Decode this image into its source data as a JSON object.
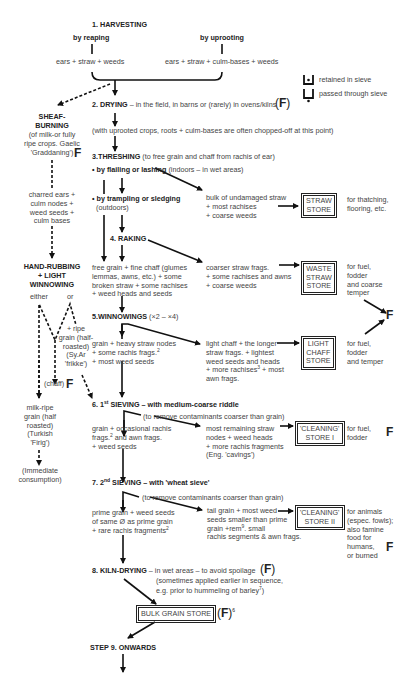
{
  "legend": {
    "retained": "retained in sieve",
    "passed": "passed through sieve"
  },
  "steps": {
    "harvesting": "1. HARVESTING",
    "by_reaping": "by reaping",
    "by_uprooting": "by uprooting",
    "reaping_products": "ears + straw + weeds",
    "uprooting_products": "ears + straw + culm-bases + weeds",
    "drying_title": "2. DRYING",
    "drying_note": " – in the field, in barns or (rarely) in ovens/kilns",
    "uprooted_note": "(with uprooted crops, roots + culm-bases are often chopped-off at this point)",
    "threshing_title": "3.THRESHING",
    "threshing_note": " (to free grain and chaff from rachis of ear)",
    "flailing_title": "• by flailing or lashing",
    "flailing_note": " (indoors – in wet areas)",
    "trampling_title": "• by trampling or sledging",
    "trampling_note": "(outdoors)",
    "raking": "4. RAKING",
    "winnowings_title": "5.WINNOWINGS",
    "winnowings_note": " (×2 – ×4)",
    "sieving1_title": "6. 1",
    "sieving1_sup": "st",
    "sieving1_rest": " SIEVING – with medium-coarse riddle",
    "sieving1_note": "(to remove contaminants coarser than grain)",
    "sieving2_title": "7. 2",
    "sieving2_sup": "nd",
    "sieving2_rest": " SIEVING – with 'wheat sieve'",
    "sieving2_note": "(to remove contaminants coarser than grain)",
    "kiln_title": "8. KILN-DRYING",
    "kiln_note": " – in wet areas – to avoid spoilage",
    "kiln_note2": "(sometimes applied earlier in sequence,",
    "kiln_note3": "e.g. prior to hummeling of barley",
    "kiln_note3_sup": "7",
    "kiln_note3_end": ")",
    "onwards": "STEP 9. ONWARDS"
  },
  "products": {
    "straw_bulk": [
      "bulk of undamaged straw",
      "+ most rachises",
      "+ coarse weeds"
    ],
    "raking_main": [
      "free grain + fine chaff (glumes",
      "lemmas, awns, etc.) + some",
      "broken straw + some rachises",
      "+ weed heads and seeds"
    ],
    "raking_coarse": [
      "coarser straw frags.",
      "+ some rachises and awns",
      "+ coarse weeds"
    ],
    "winnow_main": [
      "grain + heavy straw nodes",
      "+ some rachis frags.",
      "+ most weed seeds"
    ],
    "winnow_main_sup": "2",
    "winnow_light": [
      "light chaff + the longer",
      "straw frags. + lightest",
      "weed seeds and heads",
      "+ more rachises",
      "awn frags."
    ],
    "winnow_light_sup": "3",
    "winnow_light_tail": " + most",
    "sieve1_main": [
      "grain + occasional rachis",
      "frags.",
      " and awn frags.",
      "+ weed seeds"
    ],
    "sieve1_main_sup": "2",
    "sieve1_waste": [
      "most remaining straw",
      "nodes + weed heads",
      "+ more rachis fragments",
      "(Eng. 'cavings')"
    ],
    "sieve2_main": [
      "prime grain + weed seeds",
      "of same Ø as prime grain",
      "+ rare rachis fragments"
    ],
    "sieve2_main_sup": "2",
    "sieve2_tail": [
      "tail grain + most weed",
      "seeds smaller than prime",
      "grain +rem",
      ". small",
      "rachis segments & awn frags."
    ],
    "sieve2_tail_sup": "9"
  },
  "stores": {
    "straw": [
      "STRAW",
      "STORE"
    ],
    "waste_straw": [
      "WASTE",
      "STRAW",
      "STORE"
    ],
    "light_chaff": [
      "LIGHT",
      "CHAFF",
      "STORE"
    ],
    "cleaning1": [
      "'CLEANING'",
      "STORE I"
    ],
    "cleaning2": [
      "'CLEANING'",
      "STORE II"
    ],
    "bulk_grain": "BULK GRAIN STORE",
    "bulk_grain_sup": "6"
  },
  "uses": {
    "straw": [
      "for thatching,",
      "flooring, etc."
    ],
    "waste_straw": [
      "for fuel,",
      "fodder",
      "and coarse",
      "temper"
    ],
    "light_chaff": [
      "for fuel,",
      "fodder",
      "and temper"
    ],
    "cleaning1": [
      "for fuel,",
      "fodder"
    ],
    "cleaning2": [
      "for animals",
      "(espec. fowls);",
      "also famine",
      "food for",
      "humans,",
      "or burned"
    ]
  },
  "side_branch": {
    "sheaf_title": [
      "SHEAF-",
      "BURNING"
    ],
    "sheaf_note": [
      "(of milk-or fully",
      "ripe crops. Gaelic",
      "'Graddaning')"
    ],
    "charred": [
      "charred ears +",
      "culm nodes +",
      "weed seeds +",
      "culm bases"
    ],
    "hand_rubbing": [
      "HAND-RUBBING",
      "+ LIGHT",
      "WINNOWING"
    ],
    "either": "either",
    "or": "or",
    "ripe": [
      "+ ripe",
      "grain (half-",
      "roasted)",
      "(Sy.Ar",
      "'frikke')"
    ],
    "chaff": "(chaff)",
    "milk_ripe": [
      "milk-ripe",
      "grain (half",
      "roasted)",
      "(Turkish",
      "'Firig')"
    ],
    "immediate": [
      "(Immediate",
      "consumption)"
    ]
  },
  "fuel_marker": "F"
}
